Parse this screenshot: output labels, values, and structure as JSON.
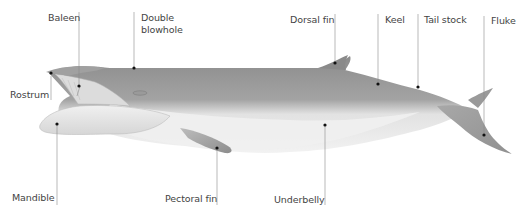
{
  "diagram": {
    "colors": {
      "dorsal": "#8f8f8f",
      "dorsal_dark": "#7a7a7a",
      "belly": "#ebebeb",
      "belly_shadow": "#cfcfcf",
      "leader_line": "#8a8a8a",
      "dot": "#111111",
      "label_text": "#444444"
    },
    "labels": [
      {
        "id": "baleen",
        "text": "Baleen"
      },
      {
        "id": "double_blowhole",
        "text": "Double\nblowhole"
      },
      {
        "id": "dorsal_fin",
        "text": "Dorsal fin"
      },
      {
        "id": "keel",
        "text": "Keel"
      },
      {
        "id": "tail_stock",
        "text": "Tail stock"
      },
      {
        "id": "fluke",
        "text": "Fluke"
      },
      {
        "id": "rostrum",
        "text": "Rostrum"
      },
      {
        "id": "mandible",
        "text": "Mandible"
      },
      {
        "id": "pectoral_fin",
        "text": "Pectoral fin"
      },
      {
        "id": "underbelly",
        "text": "Underbelly"
      }
    ]
  }
}
